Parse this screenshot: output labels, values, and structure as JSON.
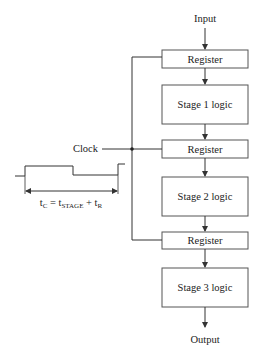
{
  "diagram": {
    "type": "pipeline",
    "input_label": "Input",
    "output_label": "Output",
    "clock_label": "Clock",
    "colors": {
      "line": "#333333",
      "box_fill": "#ffffff",
      "text": "#222222"
    },
    "blocks": [
      {
        "kind": "register",
        "label": "Register"
      },
      {
        "kind": "logic",
        "label": "Stage 1 logic"
      },
      {
        "kind": "register",
        "label": "Register"
      },
      {
        "kind": "logic",
        "label": "Stage 2 logic"
      },
      {
        "kind": "register",
        "label": "Register"
      },
      {
        "kind": "logic",
        "label": "Stage 3 logic"
      }
    ],
    "timing": {
      "formula_main": "t",
      "formula_C": "C",
      "formula_eq": " = t",
      "formula_stage": "STAGE",
      "formula_plus": " + t",
      "formula_R": "R",
      "formula_full": "tC = tSTAGE + tR"
    }
  }
}
